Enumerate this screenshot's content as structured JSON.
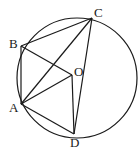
{
  "diagram": {
    "type": "geometry",
    "center": {
      "label": "O"
    },
    "points": [
      {
        "label": "B"
      },
      {
        "label": "C"
      },
      {
        "label": "A"
      },
      {
        "label": "D"
      }
    ],
    "segments": [
      [
        "B",
        "C"
      ],
      [
        "B",
        "A"
      ],
      [
        "B",
        "O"
      ],
      [
        "A",
        "O"
      ],
      [
        "A",
        "C"
      ],
      [
        "A",
        "D"
      ],
      [
        "O",
        "D"
      ],
      [
        "C",
        "D"
      ]
    ],
    "color": "#1a1a1a"
  }
}
